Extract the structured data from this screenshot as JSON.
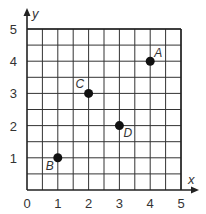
{
  "chart_data": {
    "type": "scatter",
    "title": "",
    "xlabel": "x",
    "ylabel": "y",
    "xlim": [
      0,
      5
    ],
    "ylim": [
      0,
      5
    ],
    "grid": true,
    "grid_step": 0.5,
    "x_ticks": [
      "0",
      "1",
      "2",
      "3",
      "4",
      "5"
    ],
    "y_ticks": [
      "1",
      "2",
      "3",
      "4",
      "5"
    ],
    "points": [
      {
        "label": "A",
        "x": 4,
        "y": 4
      },
      {
        "label": "B",
        "x": 1,
        "y": 1
      },
      {
        "label": "C",
        "x": 2,
        "y": 3
      },
      {
        "label": "D",
        "x": 3,
        "y": 2
      }
    ]
  },
  "colors": {
    "grid": "#333333",
    "points": "#111111"
  }
}
